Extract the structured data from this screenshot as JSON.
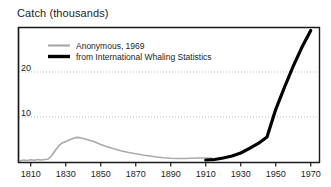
{
  "chart_data": {
    "type": "line",
    "title": "Catch (thousands)",
    "xlabel": "",
    "ylabel": "Catch (thousands)",
    "xlim": [
      1803,
      1975
    ],
    "ylim": [
      0,
      27
    ],
    "xticks": [
      1810,
      1830,
      1850,
      1870,
      1890,
      1910,
      1930,
      1950,
      1970
    ],
    "xtick_labels": [
      "1810",
      "1830",
      "1850",
      "1870",
      "1890",
      "1910",
      "1930",
      "1950",
      "1970"
    ],
    "yticks": [
      10,
      20
    ],
    "ytick_labels": [
      "10",
      "20"
    ],
    "grid": "horizontal-dotted",
    "legend_position": "upper-left-inside",
    "series": [
      {
        "name": "Anonymous,  1969",
        "color": "#aaaaaa",
        "linewidth": 1.6,
        "x": [
          1804,
          1806,
          1808,
          1810,
          1812,
          1814,
          1816,
          1818,
          1820,
          1822,
          1824,
          1826,
          1828,
          1830,
          1832,
          1834,
          1836,
          1838,
          1840,
          1842,
          1844,
          1846,
          1848,
          1850,
          1854,
          1858,
          1862,
          1866,
          1870,
          1874,
          1878,
          1882,
          1886,
          1890,
          1894,
          1898,
          1902,
          1906,
          1910,
          1914
        ],
        "values": [
          0.35,
          0.5,
          0.4,
          0.55,
          0.45,
          0.6,
          0.5,
          0.6,
          0.7,
          1.4,
          2.4,
          3.3,
          3.9,
          4.2,
          4.5,
          4.8,
          5.0,
          4.95,
          4.8,
          4.6,
          4.4,
          4.2,
          3.9,
          3.6,
          3.1,
          2.7,
          2.3,
          2.0,
          1.75,
          1.5,
          1.3,
          1.1,
          0.95,
          0.85,
          0.8,
          0.8,
          0.85,
          0.9,
          0.9,
          0.85
        ]
      },
      {
        "name": "from International Whaling Statistics",
        "color": "#000000",
        "linewidth": 3.2,
        "x": [
          1910,
          1915,
          1920,
          1925,
          1930,
          1935,
          1940,
          1945,
          1950,
          1955,
          1960,
          1965,
          1970
        ],
        "values": [
          0.5,
          0.6,
          0.9,
          1.3,
          1.9,
          2.8,
          3.8,
          5.1,
          10.6,
          15.0,
          19.2,
          23.0,
          26.3
        ]
      }
    ]
  },
  "legend": {
    "entries": [
      {
        "label": "Anonymous,  1969",
        "color": "#aaaaaa"
      },
      {
        "label": "from International Whaling Statistics",
        "color": "#000000"
      }
    ]
  }
}
